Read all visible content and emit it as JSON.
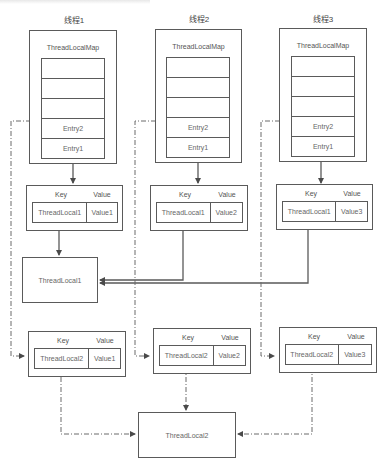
{
  "threads": [
    {
      "title": "线程1",
      "map_label": "ThreadLocalMap",
      "entries": [
        "",
        "",
        "",
        "Entry2",
        "Entry1"
      ],
      "entry1": {
        "key_header": "Key",
        "value_header": "Value",
        "key": "ThreadLocal1",
        "value": "Value1"
      },
      "entry2": {
        "key_header": "Key",
        "value_header": "Value",
        "key": "ThreadLocal2",
        "value": "Value1"
      }
    },
    {
      "title": "线程2",
      "map_label": "ThreadLocalMap",
      "entries": [
        "",
        "",
        "",
        "Entry2",
        "Entry1"
      ],
      "entry1": {
        "key_header": "Key",
        "value_header": "Value",
        "key": "ThreadLocal1",
        "value": "Value2"
      },
      "entry2": {
        "key_header": "Key",
        "value_header": "Value",
        "key": "ThreadLocal2",
        "value": "Value2"
      }
    },
    {
      "title": "线程3",
      "map_label": "ThreadLocalMap",
      "entries": [
        "",
        "",
        "",
        "Entry2",
        "Entry1"
      ],
      "entry1": {
        "key_header": "Key",
        "value_header": "Value",
        "key": "ThreadLocal1",
        "value": "Value3"
      },
      "entry2": {
        "key_header": "Key",
        "value_header": "Value",
        "key": "ThreadLocal2",
        "value": "Value3"
      }
    }
  ],
  "shared": {
    "threadlocal1": "ThreadLocal1",
    "threadlocal2": "ThreadLocal2"
  },
  "colors": {
    "line": "#5a5a5a",
    "text": "#666666"
  }
}
